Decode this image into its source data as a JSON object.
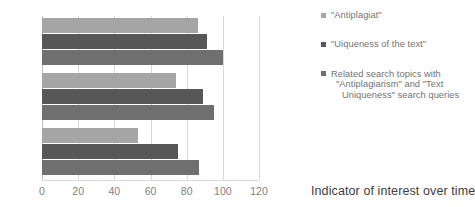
{
  "chart_data": {
    "type": "bar",
    "orientation": "horizontal",
    "title": "",
    "subtitle": "",
    "xlabel": "Indicator of interest over time",
    "ylabel": "",
    "categories": [
      "2021",
      "2020",
      "2019"
    ],
    "xlim": [
      0,
      120
    ],
    "xticks": [
      0,
      20,
      40,
      60,
      80,
      100,
      120
    ],
    "xtick_labels": [
      "0",
      "20",
      "40",
      "60",
      "80",
      "100",
      "120"
    ],
    "grid": true,
    "legend_position": "right",
    "series": [
      {
        "name": "\"Antiplagiat\"",
        "color": "#a5a5a5",
        "values": [
          86,
          74,
          53
        ]
      },
      {
        "name": "\"Uiqueness of the text\"",
        "color": "#575757",
        "values": [
          91,
          89,
          75
        ]
      },
      {
        "name": "Related search topics with \"Antiplagiarism\" and \"Text Uniqueness\" search queries",
        "color": "#6f6f6f",
        "values": [
          100,
          95,
          87
        ]
      }
    ]
  },
  "legend": {
    "items": [
      {
        "label": "\"Antiplagiat\"",
        "color": "#a5a5a5"
      },
      {
        "label": "\"Uiqueness of the text\"",
        "color": "#575757"
      },
      {
        "color": "#6f6f6f",
        "line1": "Related search topics with",
        "line2": "\"Antiplagiarism\" and \"Text",
        "line3": "Uniqueness\" search queries"
      }
    ]
  },
  "axis": {
    "x_title": "Indicator of interest over time"
  }
}
